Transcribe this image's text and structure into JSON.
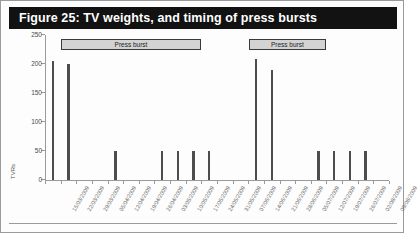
{
  "figure": {
    "title": "Figure 25: TV weights, and timing of press bursts"
  },
  "annotations": [
    {
      "label": "Press burst",
      "start_date": "22/03/2009",
      "end_date": "17/05/2009"
    },
    {
      "label": "Press burst",
      "start_date": "14/06/2009",
      "end_date": "12/07/2009"
    }
  ],
  "chart_data": {
    "type": "bar",
    "title": "Figure 25: TV weights, and timing of press bursts",
    "xlabel": "",
    "ylabel": "TVRs",
    "ylim": [
      0,
      250
    ],
    "yticks": [
      0,
      50,
      100,
      150,
      200,
      250
    ],
    "grid": false,
    "legend": null,
    "categories": [
      "15/03/2009",
      "22/03/2009",
      "29/03/2009",
      "05/04/2009",
      "12/04/2009",
      "19/04/2009",
      "26/04/2009",
      "03/05/2009",
      "10/05/2009",
      "17/05/2009",
      "24/05/2009",
      "31/05/2009",
      "07/06/2009",
      "14/06/2009",
      "21/06/2009",
      "28/06/2009",
      "05/07/2009",
      "12/07/2009",
      "19/07/2009",
      "26/07/2009",
      "02/08/2009",
      "09/08/2009"
    ],
    "values": [
      205,
      200,
      0,
      0,
      50,
      0,
      0,
      50,
      50,
      50,
      50,
      0,
      0,
      208,
      190,
      0,
      0,
      50,
      50,
      50,
      50,
      0
    ],
    "series": [
      {
        "name": "TVRs",
        "values": [
          205,
          200,
          0,
          0,
          50,
          0,
          0,
          50,
          50,
          50,
          50,
          0,
          0,
          208,
          190,
          0,
          0,
          50,
          50,
          50,
          50,
          0
        ]
      }
    ]
  }
}
